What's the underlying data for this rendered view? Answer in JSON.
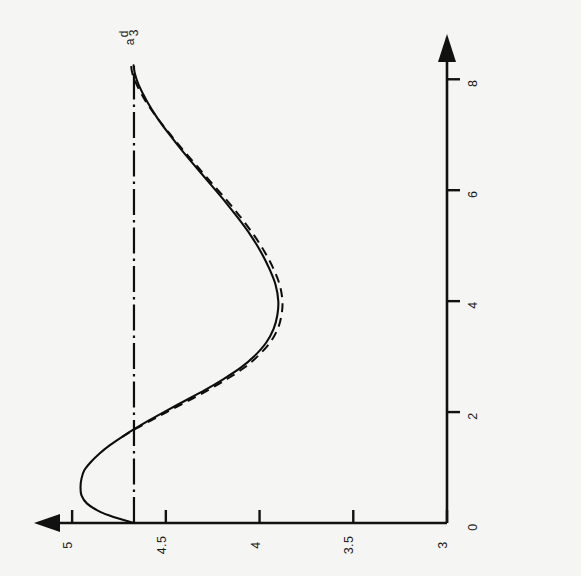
{
  "chart_data": {
    "type": "line",
    "title": "",
    "subtitle": "",
    "xlabel": "",
    "ylabel": "",
    "xlim": [
      0,
      8.6
    ],
    "ylim": [
      3,
      5.15
    ],
    "xticks": [
      0,
      2,
      4,
      6,
      8
    ],
    "xticklabels": [
      "0",
      "2",
      "4",
      "6",
      "8"
    ],
    "yticks": [
      3,
      3.5,
      4,
      4.5,
      5
    ],
    "yticklabels": [
      "3",
      "3.5",
      "4",
      "4.5",
      "5"
    ],
    "grid": false,
    "legend": null,
    "orientation": "rotated-90-ccw",
    "annotations": [
      {
        "name": "reference-level-label",
        "text": "a",
        "sub": "3",
        "sup": "d",
        "value": 4.67,
        "at_x": 8.35
      }
    ],
    "reference_lines": [
      {
        "name": "a3d-level",
        "style": "dash-dot",
        "orientation": "horizontal",
        "y": 4.67,
        "x_start": 0,
        "x_end": 8.3
      }
    ],
    "series": [
      {
        "name": "solid-curve",
        "style": "solid",
        "x": [
          0.0,
          0.1,
          0.2,
          0.35,
          0.5,
          0.65,
          0.8,
          0.95,
          1.1,
          1.25,
          1.4,
          1.55,
          1.7,
          1.85,
          2.0,
          2.2,
          2.4,
          2.6,
          2.8,
          3.0,
          3.25,
          3.5,
          3.75,
          4.0,
          4.3,
          4.6,
          4.9,
          5.2,
          5.5,
          5.8,
          6.1,
          6.4,
          6.7,
          7.0,
          7.3,
          7.6,
          7.9,
          8.1,
          8.25
        ],
        "y": [
          4.67,
          4.77,
          4.85,
          4.92,
          4.95,
          4.955,
          4.95,
          4.935,
          4.9,
          4.855,
          4.8,
          4.735,
          4.665,
          4.59,
          4.51,
          4.4,
          4.29,
          4.19,
          4.1,
          4.03,
          3.965,
          3.925,
          3.905,
          3.9,
          3.915,
          3.95,
          3.995,
          4.05,
          4.115,
          4.185,
          4.26,
          4.335,
          4.41,
          4.48,
          4.545,
          4.6,
          4.645,
          4.665,
          4.672
        ]
      },
      {
        "name": "dashed-curve",
        "style": "dashed",
        "x": [
          1.55,
          1.7,
          1.85,
          2.0,
          2.2,
          2.4,
          2.6,
          2.8,
          3.0,
          3.25,
          3.5,
          3.75,
          4.0,
          4.3,
          4.6,
          4.9,
          5.2,
          5.5,
          5.8,
          6.1,
          6.4,
          6.7,
          7.0,
          7.3,
          7.6,
          7.9,
          8.1,
          8.25
        ],
        "y": [
          4.735,
          4.66,
          4.578,
          4.495,
          4.382,
          4.272,
          4.172,
          4.082,
          4.012,
          3.945,
          3.903,
          3.883,
          3.878,
          3.893,
          3.928,
          3.975,
          4.032,
          4.098,
          4.17,
          4.248,
          4.325,
          4.402,
          4.475,
          4.545,
          4.607,
          4.655,
          4.678,
          4.686
        ]
      }
    ]
  },
  "axes": {
    "value_axis_name": "value-axis",
    "time_axis_name": "time-axis",
    "value_axis_arrow": "arrow-left",
    "time_axis_arrow": "arrow-up"
  }
}
